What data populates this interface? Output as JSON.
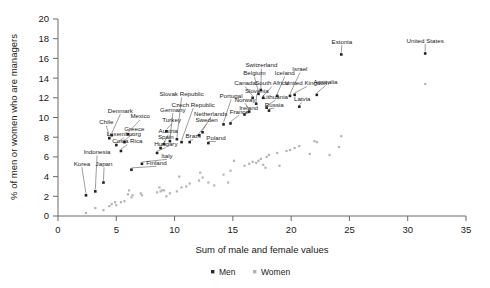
{
  "chart_data": {
    "type": "scatter",
    "title": "",
    "xlabel": "Sum of male and female values",
    "ylabel": "% of men or women who are managers",
    "xlim": [
      0,
      35
    ],
    "ylim": [
      0,
      20
    ],
    "xticks": [
      0,
      5,
      10,
      15,
      20,
      25,
      30,
      35
    ],
    "yticks": [
      0,
      2,
      4,
      6,
      8,
      10,
      12,
      14,
      16,
      18,
      20
    ],
    "grid": false,
    "legend_position": "bottom",
    "series": [
      {
        "name": "Men",
        "color": "#2b2b2b",
        "marker": "square"
      },
      {
        "name": "Women",
        "color": "#b0b0b0",
        "marker": "square"
      }
    ],
    "points": [
      {
        "label": "Korea",
        "x": 2.4,
        "men": 2.1,
        "women": 0.3,
        "lx": 2.05,
        "ly": 5.1,
        "anchor": "middle"
      },
      {
        "label": "Indonesia",
        "x": 3.2,
        "men": 2.5,
        "women": 0.8,
        "lx": 3.35,
        "ly": 6.3,
        "anchor": "middle"
      },
      {
        "label": "Japan",
        "x": 3.9,
        "men": 3.4,
        "women": 0.6,
        "lx": 3.95,
        "ly": 5.1,
        "anchor": "middle"
      },
      {
        "label": "Chile",
        "x": 4.4,
        "men": 7.9,
        "women": 1.0,
        "lx": 4.15,
        "ly": 9.3,
        "anchor": "middle"
      },
      {
        "label": "Denmark",
        "x": 4.6,
        "men": 8.2,
        "women": 1.2,
        "lx": 5.35,
        "ly": 10.5,
        "anchor": "middle"
      },
      {
        "label": "Luxembourg",
        "x": 5.0,
        "men": 7.2,
        "women": 1.1,
        "lx": 5.65,
        "ly": 8.1,
        "anchor": "middle"
      },
      {
        "label": "Costa Rica",
        "x": 5.4,
        "men": 6.6,
        "women": 1.4,
        "lx": 5.95,
        "ly": 7.4,
        "anchor": "middle"
      },
      {
        "label": "Greece",
        "x": 5.7,
        "men": 7.5,
        "women": 1.5,
        "lx": 6.55,
        "ly": 8.6,
        "anchor": "middle"
      },
      {
        "label": "Mexico",
        "x": 6.0,
        "men": 8.3,
        "women": 2.2,
        "lx": 7.05,
        "ly": 9.9,
        "anchor": "middle"
      },
      {
        "label": "Finland",
        "x": 6.3,
        "men": 4.7,
        "women": 1.9,
        "lx": 8.45,
        "ly": 5.2,
        "anchor": "middle"
      },
      {
        "label": "Italy",
        "x": 7.2,
        "men": 5.3,
        "women": 2.1,
        "lx": 9.35,
        "ly": 5.9,
        "anchor": "middle"
      },
      {
        "label": "Hungary",
        "x": 8.5,
        "men": 6.4,
        "women": 2.4,
        "lx": 9.25,
        "ly": 7.1,
        "anchor": "middle"
      },
      {
        "label": "Spain",
        "x": 8.8,
        "men": 6.9,
        "women": 2.5,
        "lx": 9.25,
        "ly": 7.8,
        "anchor": "middle"
      },
      {
        "label": "Austria",
        "x": 9.1,
        "men": 7.3,
        "women": 2.6,
        "lx": 9.45,
        "ly": 8.4,
        "anchor": "middle"
      },
      {
        "label": "Turkey",
        "x": 9.3,
        "men": 8.6,
        "women": 2.0,
        "lx": 9.75,
        "ly": 9.5,
        "anchor": "middle"
      },
      {
        "label": "Germany",
        "x": 9.6,
        "men": 7.6,
        "women": 2.3,
        "lx": 9.85,
        "ly": 10.6,
        "anchor": "middle"
      },
      {
        "label": "Slovak Republic",
        "x": 10.2,
        "men": 7.8,
        "women": 2.5,
        "lx": 10.6,
        "ly": 12.2,
        "anchor": "middle"
      },
      {
        "label": "Czech Republic",
        "x": 10.6,
        "men": 7.5,
        "women": 2.9,
        "lx": 11.6,
        "ly": 11.1,
        "anchor": "middle"
      },
      {
        "label": "Brazil",
        "x": 11.3,
        "men": 7.5,
        "women": 3.3,
        "lx": 11.6,
        "ly": 7.9,
        "anchor": "middle"
      },
      {
        "label": "Sweden",
        "x": 12.1,
        "men": 8.2,
        "women": 3.6,
        "lx": 12.75,
        "ly": 9.5,
        "anchor": "middle"
      },
      {
        "label": "Netherlands",
        "x": 12.4,
        "men": 8.5,
        "women": 3.9,
        "lx": 13.1,
        "ly": 10.2,
        "anchor": "middle"
      },
      {
        "label": "Poland",
        "x": 12.9,
        "men": 7.4,
        "women": 3.4,
        "lx": 13.55,
        "ly": 7.7,
        "anchor": "middle"
      },
      {
        "label": "Portugal",
        "x": 14.2,
        "men": 9.3,
        "women": 4.2,
        "lx": 14.85,
        "ly": 12.0,
        "anchor": "middle"
      },
      {
        "label": "France",
        "x": 14.8,
        "men": 9.4,
        "women": 4.6,
        "lx": 15.55,
        "ly": 10.4,
        "anchor": "middle"
      },
      {
        "label": "Ireland",
        "x": 16.0,
        "men": 10.3,
        "women": 5.1,
        "lx": 16.35,
        "ly": 10.8,
        "anchor": "middle"
      },
      {
        "label": "Norway",
        "x": 16.4,
        "men": 10.6,
        "women": 5.3,
        "lx": 16.05,
        "ly": 11.6,
        "anchor": "middle"
      },
      {
        "label": "Canada",
        "x": 16.7,
        "men": 12.0,
        "women": 5.5,
        "lx": 16.05,
        "ly": 13.3,
        "anchor": "middle"
      },
      {
        "label": "Slovenia",
        "x": 17.0,
        "men": 11.4,
        "women": 5.4,
        "lx": 17.05,
        "ly": 12.5,
        "anchor": "middle"
      },
      {
        "label": "Belgium",
        "x": 17.2,
        "men": 12.4,
        "women": 5.6,
        "lx": 16.85,
        "ly": 14.3,
        "anchor": "middle"
      },
      {
        "label": "Switzerland",
        "x": 17.4,
        "men": 12.8,
        "women": 5.8,
        "lx": 17.45,
        "ly": 15.1,
        "anchor": "middle"
      },
      {
        "label": "South Africa",
        "x": 17.6,
        "men": 12.0,
        "women": 5.2,
        "lx": 18.35,
        "ly": 13.3,
        "anchor": "middle"
      },
      {
        "label": "Lithuania",
        "x": 17.9,
        "men": 11.0,
        "women": 6.0,
        "lx": 18.65,
        "ly": 11.9,
        "anchor": "middle"
      },
      {
        "label": "Russia",
        "x": 18.1,
        "men": 10.7,
        "women": 6.2,
        "lx": 18.55,
        "ly": 11.1,
        "anchor": "middle"
      },
      {
        "label": "Iceland",
        "x": 18.8,
        "men": 12.2,
        "women": 6.4,
        "lx": 19.45,
        "ly": 14.3,
        "anchor": "middle"
      },
      {
        "label": "Israel",
        "x": 19.9,
        "men": 12.2,
        "women": 6.7,
        "lx": 20.75,
        "ly": 14.7,
        "anchor": "middle"
      },
      {
        "label": "United Kingdom",
        "x": 20.3,
        "men": 12.3,
        "women": 6.9,
        "lx": 21.35,
        "ly": 13.3,
        "anchor": "middle"
      },
      {
        "label": "Latvia",
        "x": 20.7,
        "men": 11.1,
        "women": 7.1,
        "lx": 20.95,
        "ly": 11.7,
        "anchor": "middle"
      },
      {
        "label": "Australia",
        "x": 22.2,
        "men": 12.3,
        "women": 7.5,
        "lx": 22.95,
        "ly": 13.4,
        "anchor": "middle"
      },
      {
        "label": "Estonia",
        "x": 24.3,
        "men": 16.4,
        "women": 8.1,
        "lx": 24.35,
        "ly": 17.5,
        "anchor": "middle"
      },
      {
        "label": "United States",
        "x": 31.5,
        "men": 16.5,
        "women": 13.4,
        "lx": 31.5,
        "ly": 17.6,
        "anchor": "middle"
      }
    ],
    "extra_women": [
      {
        "x": 4.9,
        "y": 1.4
      },
      {
        "x": 6.1,
        "y": 2.6
      },
      {
        "x": 6.4,
        "y": 2.1
      },
      {
        "x": 7.1,
        "y": 2.3
      },
      {
        "x": 8.7,
        "y": 2.9
      },
      {
        "x": 8.9,
        "y": 2.6
      },
      {
        "x": 10.4,
        "y": 4.0
      },
      {
        "x": 11.0,
        "y": 3.0
      },
      {
        "x": 12.2,
        "y": 4.4
      },
      {
        "x": 13.4,
        "y": 3.1
      },
      {
        "x": 14.6,
        "y": 3.4
      },
      {
        "x": 15.1,
        "y": 5.6
      },
      {
        "x": 17.8,
        "y": 4.9
      },
      {
        "x": 19.0,
        "y": 5.1
      },
      {
        "x": 19.6,
        "y": 6.6
      },
      {
        "x": 21.6,
        "y": 6.3
      },
      {
        "x": 22.0,
        "y": 7.6
      },
      {
        "x": 23.3,
        "y": 6.2
      },
      {
        "x": 24.1,
        "y": 7.0
      }
    ]
  },
  "legend": {
    "men_label": "Men",
    "women_label": "Women"
  }
}
